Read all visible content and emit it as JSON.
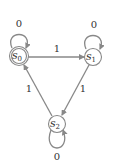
{
  "diagram": {
    "type": "finite-state-machine",
    "colors": {
      "stroke": "#888888",
      "text": "#333333",
      "background": "#ffffff"
    },
    "states": [
      {
        "id": "s0",
        "label": "s",
        "subscript": "0",
        "accepting": true,
        "start": false
      },
      {
        "id": "s1",
        "label": "s",
        "subscript": "1",
        "accepting": false,
        "start": false
      },
      {
        "id": "s2",
        "label": "s",
        "subscript": "2",
        "accepting": false,
        "start": false
      }
    ],
    "transitions": [
      {
        "from": "s0",
        "to": "s0",
        "label": "0"
      },
      {
        "from": "s0",
        "to": "s1",
        "label": "1"
      },
      {
        "from": "s1",
        "to": "s1",
        "label": "0"
      },
      {
        "from": "s1",
        "to": "s2",
        "label": "1"
      },
      {
        "from": "s2",
        "to": "s2",
        "label": "0"
      },
      {
        "from": "s2",
        "to": "s0",
        "label": "1"
      }
    ]
  }
}
